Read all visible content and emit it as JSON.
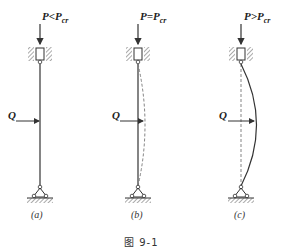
{
  "figure": {
    "caption": "图 9-1",
    "panels": [
      {
        "id": "a",
        "label": "(a)",
        "load_label_p": "P",
        "load_label_rel": "<",
        "load_label_crit": "P",
        "load_label_sub": "cr",
        "lateral_load": "Q",
        "state": "stable - straight column"
      },
      {
        "id": "b",
        "label": "(b)",
        "load_label_p": "P",
        "load_label_rel": "=",
        "load_label_crit": "P",
        "load_label_sub": "cr",
        "lateral_load": "Q",
        "state": "neutral equilibrium - slight deflection"
      },
      {
        "id": "c",
        "label": "(c)",
        "load_label_p": "P",
        "load_label_rel": ">",
        "load_label_crit": "P",
        "load_label_sub": "cr",
        "lateral_load": "Q",
        "state": "unstable - buckled column"
      }
    ]
  },
  "colors": {
    "line": "#333333",
    "dashed": "#777777",
    "hatch": "#555555"
  }
}
